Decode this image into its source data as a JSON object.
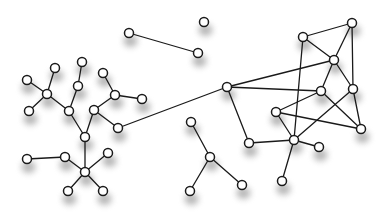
{
  "diagram": {
    "type": "network-graph",
    "background": "#ffffff",
    "node_fill": "#ffffff",
    "node_stroke": "#1a1a1a",
    "edge_color": "#1a1a1a",
    "shadow_color": "#7a7a7a",
    "node_radius": 4.5,
    "nodes": [
      {
        "id": "n1",
        "x": 129,
        "y": 33
      },
      {
        "id": "n2",
        "x": 198,
        "y": 53
      },
      {
        "id": "n3",
        "x": 204,
        "y": 22
      },
      {
        "id": "n4",
        "x": 55,
        "y": 68
      },
      {
        "id": "n5",
        "x": 27,
        "y": 80
      },
      {
        "id": "n6",
        "x": 47,
        "y": 94
      },
      {
        "id": "n7",
        "x": 29,
        "y": 111
      },
      {
        "id": "n8",
        "x": 69,
        "y": 111
      },
      {
        "id": "n9",
        "x": 78,
        "y": 86
      },
      {
        "id": "n10",
        "x": 82,
        "y": 62
      },
      {
        "id": "n11",
        "x": 103,
        "y": 73
      },
      {
        "id": "n12",
        "x": 115,
        "y": 95
      },
      {
        "id": "n13",
        "x": 142,
        "y": 99
      },
      {
        "id": "n14",
        "x": 94,
        "y": 110
      },
      {
        "id": "n15",
        "x": 118,
        "y": 128
      },
      {
        "id": "n16",
        "x": 85,
        "y": 137
      },
      {
        "id": "n17",
        "x": 27,
        "y": 159
      },
      {
        "id": "n18",
        "x": 65,
        "y": 157
      },
      {
        "id": "n19",
        "x": 108,
        "y": 153
      },
      {
        "id": "n20",
        "x": 85,
        "y": 172
      },
      {
        "id": "n21",
        "x": 68,
        "y": 191
      },
      {
        "id": "n22",
        "x": 103,
        "y": 191
      },
      {
        "id": "n23",
        "x": 227,
        "y": 87
      },
      {
        "id": "n24",
        "x": 303,
        "y": 37
      },
      {
        "id": "n25",
        "x": 352,
        "y": 23
      },
      {
        "id": "n26",
        "x": 334,
        "y": 60
      },
      {
        "id": "n27",
        "x": 321,
        "y": 91
      },
      {
        "id": "n28",
        "x": 353,
        "y": 89
      },
      {
        "id": "n29",
        "x": 276,
        "y": 112
      },
      {
        "id": "n30",
        "x": 361,
        "y": 129
      },
      {
        "id": "n31",
        "x": 249,
        "y": 143
      },
      {
        "id": "n32",
        "x": 294,
        "y": 140
      },
      {
        "id": "n33",
        "x": 319,
        "y": 147
      },
      {
        "id": "n34",
        "x": 282,
        "y": 181
      },
      {
        "id": "n35",
        "x": 191,
        "y": 122
      },
      {
        "id": "n36",
        "x": 210,
        "y": 157
      },
      {
        "id": "n37",
        "x": 190,
        "y": 191
      },
      {
        "id": "n38",
        "x": 242,
        "y": 185
      }
    ],
    "edges": [
      [
        "n1",
        "n2"
      ],
      [
        "n6",
        "n4"
      ],
      [
        "n6",
        "n5"
      ],
      [
        "n6",
        "n7"
      ],
      [
        "n6",
        "n8"
      ],
      [
        "n8",
        "n9"
      ],
      [
        "n9",
        "n10"
      ],
      [
        "n8",
        "n16"
      ],
      [
        "n11",
        "n12"
      ],
      [
        "n12",
        "n13"
      ],
      [
        "n12",
        "n14"
      ],
      [
        "n14",
        "n15"
      ],
      [
        "n14",
        "n16"
      ],
      [
        "n16",
        "n20"
      ],
      [
        "n17",
        "n18"
      ],
      [
        "n18",
        "n20"
      ],
      [
        "n20",
        "n19"
      ],
      [
        "n20",
        "n21"
      ],
      [
        "n20",
        "n22"
      ],
      [
        "n15",
        "n23"
      ],
      [
        "n23",
        "n26"
      ],
      [
        "n23",
        "n27"
      ],
      [
        "n23",
        "n31"
      ],
      [
        "n24",
        "n25"
      ],
      [
        "n24",
        "n26"
      ],
      [
        "n24",
        "n32"
      ],
      [
        "n25",
        "n26"
      ],
      [
        "n25",
        "n28"
      ],
      [
        "n26",
        "n27"
      ],
      [
        "n26",
        "n28"
      ],
      [
        "n27",
        "n29"
      ],
      [
        "n27",
        "n30"
      ],
      [
        "n28",
        "n30"
      ],
      [
        "n28",
        "n32"
      ],
      [
        "n29",
        "n30"
      ],
      [
        "n29",
        "n32"
      ],
      [
        "n31",
        "n32"
      ],
      [
        "n32",
        "n33"
      ],
      [
        "n32",
        "n34"
      ],
      [
        "n35",
        "n36"
      ],
      [
        "n36",
        "n37"
      ],
      [
        "n36",
        "n38"
      ]
    ]
  }
}
